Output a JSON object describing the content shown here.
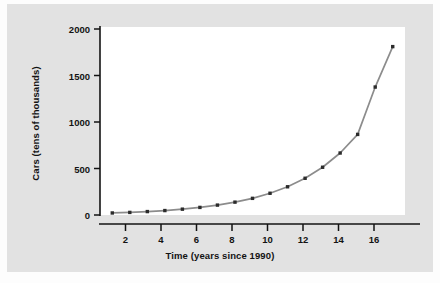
{
  "figure": {
    "background_color": "#e2e2e2",
    "plot_background_color": "#ffffff",
    "outer_color": "#fdfdfd",
    "axis_color": "#131313",
    "series_line_color": "#8c8c8c",
    "marker_color": "#2b2b2b"
  },
  "chart_data": {
    "type": "line",
    "title": "",
    "xlabel": "Time (years since 1990)",
    "ylabel": "Cars (tens of thousands)",
    "xlim": [
      0.3,
      17.7
    ],
    "ylim": [
      0,
      2060
    ],
    "xticks": [
      2,
      4,
      6,
      8,
      10,
      12,
      14,
      16
    ],
    "yticks": [
      0,
      500,
      1000,
      1500,
      2000
    ],
    "xtick_labels": [
      "2",
      "4",
      "6",
      "8",
      "10",
      "12",
      "14",
      "16"
    ],
    "ytick_labels": [
      "0",
      "500",
      "1000",
      "1500",
      "2000"
    ],
    "grid": false,
    "legend": false,
    "marker": "square",
    "x": [
      1,
      2,
      3,
      4,
      5,
      6,
      7,
      8,
      9,
      10,
      11,
      12,
      13,
      14,
      15,
      16,
      17
    ],
    "values": [
      22,
      28,
      37,
      48,
      63,
      82,
      107,
      139,
      180,
      235,
      305,
      397,
      516,
      670,
      871,
      1383,
      1820
    ],
    "series": [
      {
        "name": "Cars",
        "values": [
          22,
          28,
          37,
          48,
          63,
          82,
          107,
          139,
          180,
          235,
          305,
          397,
          516,
          670,
          871,
          1383,
          1820
        ]
      }
    ]
  }
}
